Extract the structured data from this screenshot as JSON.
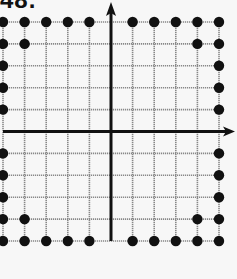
{
  "problem_label": "48.",
  "grid": {
    "x_min": -5,
    "x_max": 5,
    "y_min": -5,
    "y_max": 5,
    "origin_px": [
      111,
      131.5
    ],
    "left_px": 3,
    "right_px": 219,
    "top_px": 22,
    "bottom_px": 241,
    "line_color": "#888888",
    "axis_color": "#111111",
    "dot_color": "#111111"
  },
  "axes": {
    "x_arrow": "right",
    "y_arrow": "top",
    "x_axis_end_px": 235,
    "y_axis_top_px": 2
  },
  "points": [
    [
      -5,
      5
    ],
    [
      -4,
      5
    ],
    [
      -3,
      5
    ],
    [
      -2,
      5
    ],
    [
      -1,
      5
    ],
    [
      1,
      5
    ],
    [
      2,
      5
    ],
    [
      3,
      5
    ],
    [
      4,
      5
    ],
    [
      5,
      5
    ],
    [
      -5,
      4
    ],
    [
      -4,
      4
    ],
    [
      4,
      4
    ],
    [
      5,
      4
    ],
    [
      -5,
      3
    ],
    [
      -5,
      2
    ],
    [
      -5,
      1
    ],
    [
      -5,
      -1
    ],
    [
      -5,
      -2
    ],
    [
      -5,
      -3
    ],
    [
      5,
      3
    ],
    [
      5,
      2
    ],
    [
      5,
      1
    ],
    [
      5,
      -1
    ],
    [
      5,
      -2
    ],
    [
      5,
      -3
    ],
    [
      -5,
      -4
    ],
    [
      -4,
      -4
    ],
    [
      4,
      -4
    ],
    [
      5,
      -4
    ],
    [
      -5,
      -5
    ],
    [
      -4,
      -5
    ],
    [
      -3,
      -5
    ],
    [
      -2,
      -5
    ],
    [
      -1,
      -5
    ],
    [
      1,
      -5
    ],
    [
      2,
      -5
    ],
    [
      3,
      -5
    ],
    [
      4,
      -5
    ],
    [
      5,
      -5
    ]
  ]
}
